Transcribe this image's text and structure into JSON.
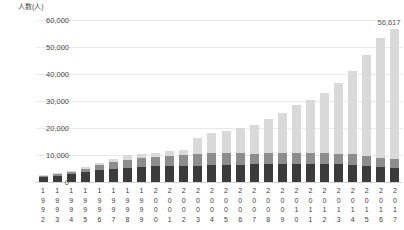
{
  "chart_data": {
    "type": "bar",
    "stacked": true,
    "title": "",
    "subtitle": "",
    "xlabel": "",
    "ylabel": "人数(人)",
    "ylim": [
      0,
      60000
    ],
    "yticks": [
      0,
      10000,
      20000,
      30000,
      40000,
      50000,
      60000
    ],
    "ytick_labels": [
      "0",
      "10,000",
      "20,000",
      "30,000",
      "40,000",
      "50,000",
      "60,000"
    ],
    "grid": true,
    "legend": "none",
    "categories": [
      "1992",
      "1993",
      "1994",
      "1995",
      "1996",
      "1997",
      "1998",
      "1999",
      "2000",
      "2001",
      "2002",
      "2003",
      "2004",
      "2005",
      "2006",
      "2007",
      "2008",
      "2009",
      "2010",
      "2011",
      "2012",
      "2013",
      "2014",
      "2015",
      "2016",
      "2017"
    ],
    "series": [
      {
        "name": "segment-1",
        "color": "#3b3b3b",
        "values": [
          1900,
          2300,
          2900,
          3600,
          4400,
          4900,
          5300,
          5600,
          5800,
          5900,
          6000,
          6100,
          6200,
          6300,
          6400,
          6500,
          6600,
          6700,
          6700,
          6700,
          6600,
          6500,
          6300,
          6000,
          5600,
          5300
        ]
      },
      {
        "name": "segment-2",
        "color": "#8d8d8d",
        "values": [
          500,
          700,
          900,
          1200,
          1800,
          2500,
          3000,
          3200,
          3300,
          3600,
          3900,
          4400,
          4500,
          4500,
          4300,
          4000,
          4000,
          4000,
          4000,
          4000,
          4000,
          4000,
          4000,
          3800,
          3400,
          3200
        ]
      },
      {
        "name": "segment-3",
        "color": "#d9d9d9",
        "values": [
          200,
          300,
          400,
          700,
          800,
          1200,
          1800,
          1700,
          1700,
          2000,
          2100,
          5800,
          7300,
          8100,
          9400,
          10500,
          12700,
          14800,
          17900,
          19500,
          22500,
          26300,
          30700,
          37200,
          44300,
          48100
        ]
      }
    ],
    "totals": [
      2600,
      3300,
      4200,
      5500,
      7000,
      8600,
      10100,
      10500,
      10800,
      11500,
      12000,
      16300,
      18000,
      18900,
      20100,
      21000,
      23300,
      25500,
      28600,
      30200,
      33100,
      36800,
      41000,
      47000,
      53300,
      56617
    ],
    "annotations": [
      {
        "text": "56,617",
        "category": "2017",
        "value": 56617
      }
    ]
  }
}
